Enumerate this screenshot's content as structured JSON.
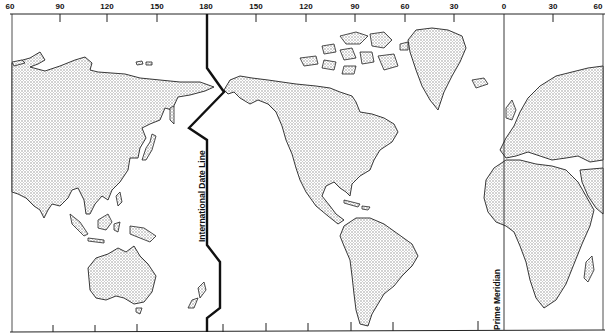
{
  "map": {
    "title": "World map with International Date Line and Prime Meridian",
    "top_axis_labels": [
      {
        "label": "60",
        "x": 10
      },
      {
        "label": "90",
        "x": 60
      },
      {
        "label": "120",
        "x": 107
      },
      {
        "label": "150",
        "x": 157
      },
      {
        "label": "180",
        "x": 206
      },
      {
        "label": "150",
        "x": 256
      },
      {
        "label": "120",
        "x": 306
      },
      {
        "label": "90",
        "x": 355
      },
      {
        "label": "30",
        "x": 454
      },
      {
        "label": "60",
        "x": 405
      },
      {
        "label": "0",
        "x": 504
      },
      {
        "label": "30",
        "x": 553
      },
      {
        "label": "60",
        "x": 600
      }
    ],
    "date_line_label": "International Date Line",
    "prime_meridian_label": "Prime Meridian",
    "land_color": "#d9d9d9",
    "line_color": "#111111"
  }
}
